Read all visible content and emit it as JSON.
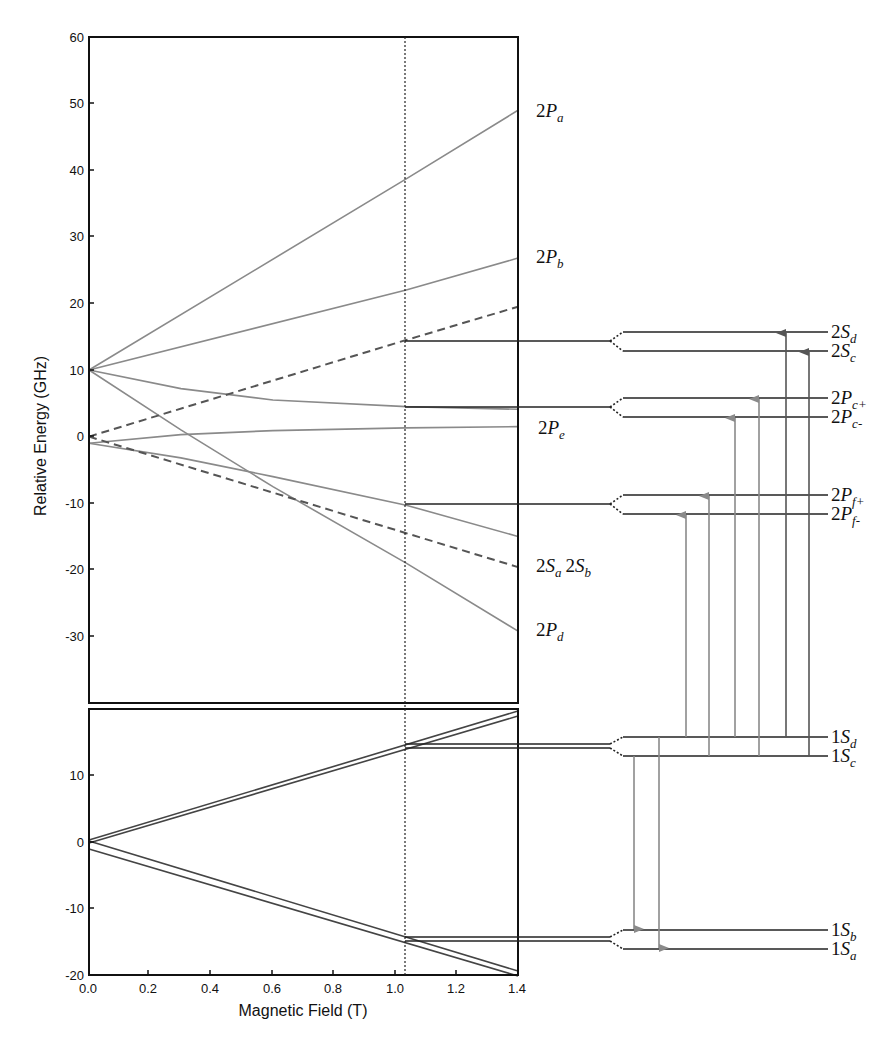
{
  "chart_data": {
    "type": "line",
    "title": "",
    "xlabel": "Magnetic Field (T)",
    "ylabel": "Relative Energy (GHz)",
    "marker_field_T": 1.035,
    "panels": [
      {
        "name": "upper",
        "xlim": [
          0.0,
          1.4
        ],
        "ylim": [
          -40,
          60
        ],
        "xticks": [
          "0.0",
          "0.2",
          "0.4",
          "0.6",
          "0.8",
          "1.0",
          "1.2",
          "1.4"
        ],
        "yticks": [
          60,
          50,
          40,
          30,
          20,
          10,
          0,
          -10,
          -20,
          -30
        ],
        "series": [
          {
            "name": "2P_a",
            "style": "solid",
            "x": [
              0,
              1.035,
              1.4
            ],
            "y": [
              10,
              38.7,
              49
            ]
          },
          {
            "name": "2P_b",
            "style": "solid",
            "x": [
              0,
              1.035,
              1.4
            ],
            "y": [
              10,
              22,
              26.8
            ]
          },
          {
            "name": "2S_c/2S_d",
            "style": "dashed",
            "x": [
              0,
              1.035,
              1.4
            ],
            "y": [
              0,
              14.5,
              19.5
            ]
          },
          {
            "name": "2P_c",
            "style": "solid",
            "x": [
              0,
              0.3,
              0.6,
              1.035,
              1.4
            ],
            "y": [
              10,
              7.2,
              5.5,
              4.5,
              4.1
            ]
          },
          {
            "name": "2P_e",
            "style": "solid",
            "x": [
              0,
              0.3,
              0.6,
              1.035,
              1.4
            ],
            "y": [
              -1,
              0.3,
              0.9,
              1.3,
              1.5
            ]
          },
          {
            "name": "2P_f",
            "style": "solid",
            "x": [
              0,
              0.3,
              0.6,
              1.035,
              1.4
            ],
            "y": [
              -1,
              -3.2,
              -6,
              -10.3,
              -15
            ]
          },
          {
            "name": "2S_a 2S_b",
            "style": "dashed",
            "x": [
              0,
              1.035,
              1.4
            ],
            "y": [
              0,
              -14.5,
              -19.6
            ]
          },
          {
            "name": "2P_d",
            "style": "solid",
            "x": [
              0,
              0.3,
              0.6,
              1.035,
              1.4
            ],
            "y": [
              10,
              1,
              -7.5,
              -19,
              -29.2
            ]
          }
        ]
      },
      {
        "name": "lower",
        "xlim": [
          0.0,
          1.4
        ],
        "ylim": [
          -20,
          20
        ],
        "xticks": [
          "0.0",
          "0.2",
          "0.4",
          "0.6",
          "0.8",
          "1.0",
          "1.2",
          "1.4"
        ],
        "yticks": [
          10,
          0,
          -10,
          -20
        ],
        "series": [
          {
            "name": "1S_d",
            "style": "double",
            "x": [
              0,
              1.035,
              1.4
            ],
            "y": [
              0.3,
              14.6,
              19.6
            ]
          },
          {
            "name": "1S_c",
            "style": "double",
            "x": [
              0,
              1.035,
              1.4
            ],
            "y": [
              -0.2,
              14.0,
              19.0
            ]
          },
          {
            "name": "1S_b",
            "style": "double",
            "x": [
              0,
              1.035,
              1.4
            ],
            "y": [
              0.1,
              -14.4,
              -19.4
            ]
          },
          {
            "name": "1S_a",
            "style": "double",
            "x": [
              0,
              1.035,
              1.4
            ],
            "y": [
              -1.0,
              -15.0,
              -20.0
            ]
          }
        ]
      }
    ],
    "energy_levels": [
      {
        "group": "2S",
        "split": [
          "2S_d",
          "2S_c"
        ]
      },
      {
        "group": "2P_c",
        "split": [
          "2P_c+",
          "2P_c-"
        ]
      },
      {
        "group": "2P_f",
        "split": [
          "2P_f+",
          "2P_f-"
        ]
      },
      {
        "group": "1S_cd",
        "split": [
          "1S_d",
          "1S_c"
        ]
      },
      {
        "group": "1S_ab",
        "split": [
          "1S_b",
          "1S_a"
        ]
      }
    ],
    "transitions": [
      {
        "from": "1S_c",
        "to": "1S_b",
        "direction": "down"
      },
      {
        "from": "1S_d",
        "to": "1S_a",
        "direction": "down"
      },
      {
        "from": "1S_d",
        "to": "2P_f-",
        "direction": "up"
      },
      {
        "from": "1S_c",
        "to": "2P_f+",
        "direction": "up"
      },
      {
        "from": "1S_d",
        "to": "2P_c-",
        "direction": "up"
      },
      {
        "from": "1S_c",
        "to": "2P_c+",
        "direction": "up"
      },
      {
        "from": "1S_d",
        "to": "2S_d",
        "direction": "up"
      },
      {
        "from": "1S_c",
        "to": "2S_c",
        "direction": "up"
      }
    ]
  },
  "axes": {
    "xlabel": "Magnetic Field (T)",
    "ylabel": "Relative Energy (GHz)",
    "xticks": [
      "0.0",
      "0.2",
      "0.4",
      "0.6",
      "0.8",
      "1.0",
      "1.2",
      "1.4"
    ],
    "upper_yticks": [
      "60",
      "50",
      "40",
      "30",
      "20",
      "10",
      "0",
      "-10",
      "-20",
      "-30"
    ],
    "lower_yticks": [
      "10",
      "0",
      "-10",
      "-20"
    ]
  },
  "curve_labels": {
    "p2a": {
      "main": "2",
      "it": "P",
      "sub": "a"
    },
    "p2b": {
      "main": "2",
      "it": "P",
      "sub": "b"
    },
    "p2e": {
      "main": "2",
      "it": "P",
      "sub": "e"
    },
    "s2ab": {
      "main": "2",
      "it": "S",
      "sub": "a",
      "main2": "2",
      "it2": "S",
      "sub2": "b"
    },
    "p2d": {
      "main": "2",
      "it": "P",
      "sub": "d"
    }
  },
  "level_labels": {
    "s2d": {
      "main": "2",
      "it": "S",
      "sub": "d"
    },
    "s2c": {
      "main": "2",
      "it": "S",
      "sub": "c"
    },
    "p2cp": {
      "main": "2",
      "it": "P",
      "sub": "c+"
    },
    "p2cm": {
      "main": "2",
      "it": "P",
      "sub": "c-"
    },
    "p2fp": {
      "main": "2",
      "it": "P",
      "sub": "f+"
    },
    "p2fm": {
      "main": "2",
      "it": "P",
      "sub": "f-"
    },
    "s1d": {
      "main": "1",
      "it": "S",
      "sub": "d"
    },
    "s1c": {
      "main": "1",
      "it": "S",
      "sub": "c"
    },
    "s1b": {
      "main": "1",
      "it": "S",
      "sub": "b"
    },
    "s1a": {
      "main": "1",
      "it": "S",
      "sub": "a"
    }
  },
  "colors": {
    "frame": "#111111",
    "curve": "#8a8a8a",
    "dashed": "#555555",
    "level": "#222222",
    "arrow_light": "#8a8a8a",
    "arrow_dark": "#555555"
  }
}
